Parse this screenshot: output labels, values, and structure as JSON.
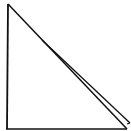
{
  "diagram": {
    "type": "right-triangle-sketch",
    "stroke_color": "#111111",
    "background": "#ffffff",
    "vertices": {
      "apex": [
        8,
        4
      ],
      "bottom_left": [
        7,
        128
      ],
      "bottom_right": [
        128,
        128
      ]
    },
    "hypotenuse_double_line": true
  }
}
